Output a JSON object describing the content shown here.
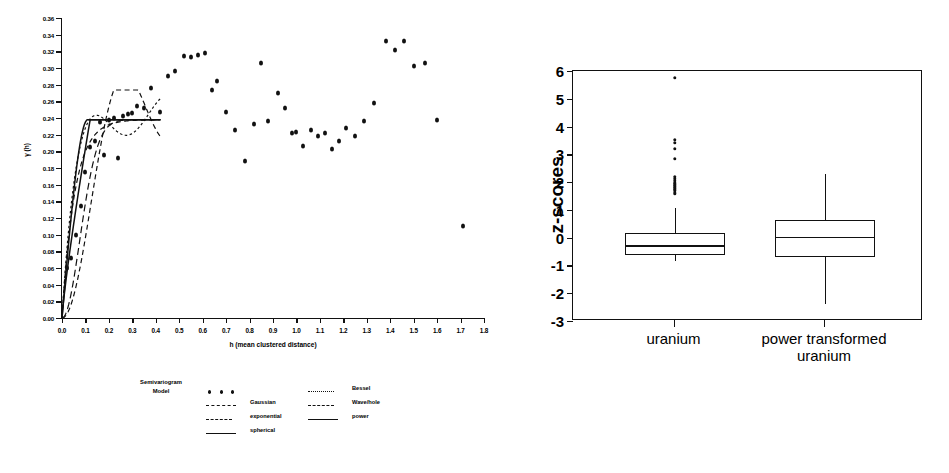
{
  "figure": {
    "panels": [
      "semivariogram-scatter",
      "z-score-boxplot"
    ]
  },
  "semivariogram": {
    "ylabel": "γ (h)",
    "xlabel": "h (mean clustered distance)",
    "ytick_labels": [
      "0.00",
      "0.02",
      "0.04",
      "0.06",
      "0.08",
      "0.10",
      "0.12",
      "0.14",
      "0.16",
      "0.18",
      "0.20",
      "0.22",
      "0.24",
      "0.26",
      "0.28",
      "0.30",
      "0.32",
      "0.34",
      "0.36"
    ],
    "xtick_labels": [
      "0.0",
      "0.1",
      "0.2",
      "0.3",
      "0.4",
      "0.5",
      "0.6",
      "0.7",
      "0.8",
      "0.9",
      "1.0",
      "1.1",
      "1.2",
      "1.3",
      "1.4",
      "1.5",
      "1.6",
      "1.7",
      "1.8"
    ],
    "legend": {
      "title_line1": "Semivariogram",
      "title_line2": "Model",
      "column1": [
        {
          "label": "",
          "key": "dots"
        },
        {
          "label": "Gaussian",
          "key": "dash-long"
        },
        {
          "label": "exponential",
          "key": "dash-med"
        },
        {
          "label": "spherical",
          "key": "solid"
        }
      ],
      "column2": [
        {
          "label": "Bessel",
          "key": "dash-short"
        },
        {
          "label": "Wave/hole",
          "key": "dash-med"
        },
        {
          "label": "power",
          "key": "solid"
        }
      ]
    }
  },
  "chart_data": [
    {
      "type": "scatter",
      "id": "semivariogram",
      "title": "",
      "xlabel": "h (mean clustered distance)",
      "ylabel": "γ (h)",
      "xlim": [
        0.0,
        1.8
      ],
      "ylim": [
        0.0,
        0.36
      ],
      "grid": false,
      "legend_position": "below-plot",
      "x": [
        0.02,
        0.04,
        0.06,
        0.08,
        0.1,
        0.12,
        0.14,
        0.16,
        0.18,
        0.2,
        0.22,
        0.24,
        0.26,
        0.28,
        0.3,
        0.32,
        0.35,
        0.38,
        0.42,
        0.45,
        0.48,
        0.52,
        0.55,
        0.58,
        0.61,
        0.64,
        0.66,
        0.7,
        0.74,
        0.78,
        0.82,
        0.85,
        0.88,
        0.92,
        0.95,
        0.98,
        1.0,
        1.03,
        1.06,
        1.09,
        1.12,
        1.15,
        1.18,
        1.21,
        1.25,
        1.29,
        1.33,
        1.38,
        1.42,
        1.46,
        1.5,
        1.55,
        1.6,
        1.71
      ],
      "y": [
        0.06,
        0.072,
        0.1,
        0.135,
        0.175,
        0.205,
        0.212,
        0.235,
        0.196,
        0.238,
        0.24,
        0.192,
        0.243,
        0.245,
        0.246,
        0.254,
        0.252,
        0.276,
        0.247,
        0.29,
        0.296,
        0.315,
        0.313,
        0.316,
        0.318,
        0.274,
        0.284,
        0.247,
        0.226,
        0.189,
        0.233,
        0.306,
        0.236,
        0.27,
        0.252,
        0.222,
        0.223,
        0.206,
        0.226,
        0.219,
        0.222,
        0.203,
        0.212,
        0.228,
        0.219,
        0.236,
        0.258,
        0.332,
        0.322,
        0.332,
        0.303,
        0.306,
        0.238,
        0.11
      ],
      "series_models": [
        {
          "name": "dots",
          "label": "data points",
          "style": "markers"
        },
        {
          "name": "Gaussian",
          "label": "Gaussian",
          "style": "long-dash",
          "nugget": 0.0,
          "sill": 0.238,
          "range": 0.16
        },
        {
          "name": "exponential",
          "label": "exponential",
          "style": "med-dash",
          "nugget": 0.0,
          "sill": 0.238,
          "range": 0.13
        },
        {
          "name": "spherical",
          "label": "spherical",
          "style": "solid",
          "nugget": 0.0,
          "sill": 0.238,
          "range": 0.11
        },
        {
          "name": "Bessel",
          "label": "Bessel",
          "style": "short-dash",
          "nugget": 0.0,
          "sill": 0.245,
          "range": 0.14
        },
        {
          "name": "Wave/hole",
          "label": "Wave/hole",
          "style": "med-dash",
          "nugget": 0.0,
          "sill": 0.24,
          "range": 0.15
        },
        {
          "name": "power",
          "label": "power",
          "style": "solid",
          "nugget": 0.0,
          "sill": 0.238,
          "range": 0.12
        }
      ]
    },
    {
      "type": "boxplot",
      "id": "z-score-boxplot",
      "title": "",
      "xlabel": "",
      "ylabel": "z-scores",
      "ylim": [
        -3,
        6
      ],
      "ytick_labels": [
        "6",
        "5",
        "4",
        "3",
        "2",
        "1",
        "0",
        "-1",
        "-2",
        "-3"
      ],
      "ytick_values": [
        6,
        5,
        4,
        3,
        2,
        1,
        0,
        -1,
        -2,
        -3
      ],
      "grid": false,
      "categories": [
        "uranium",
        "power transformed uranium"
      ],
      "boxes": [
        {
          "name": "uranium",
          "label_lines": [
            "uranium"
          ],
          "whisker_low": -0.85,
          "q1": -0.62,
          "median": -0.28,
          "q3": 0.18,
          "whisker_high": 1.07,
          "outliers": [
            1.6,
            1.7,
            1.78,
            1.85,
            1.92,
            1.98,
            2.05,
            2.12,
            2.2,
            2.85,
            3.2,
            3.42,
            3.52,
            5.75
          ]
        },
        {
          "name": "power transformed uranium",
          "label_lines": [
            "power transformed",
            "uranium"
          ],
          "whisker_low": -2.4,
          "q1": -0.7,
          "median": 0.02,
          "q3": 0.65,
          "whisker_high": 2.28,
          "outliers": []
        }
      ]
    }
  ],
  "boxplot": {
    "ylabel": "z-scores",
    "ytick_labels": [
      "6",
      "5",
      "4",
      "3",
      "2",
      "1",
      "0",
      "-1",
      "-2",
      "-3"
    ],
    "category_labels": [
      {
        "line1": "uranium",
        "line2": ""
      },
      {
        "line1": "power transformed",
        "line2": "uranium"
      }
    ]
  },
  "colors": {
    "ink": "#111111",
    "background": "#ffffff"
  }
}
